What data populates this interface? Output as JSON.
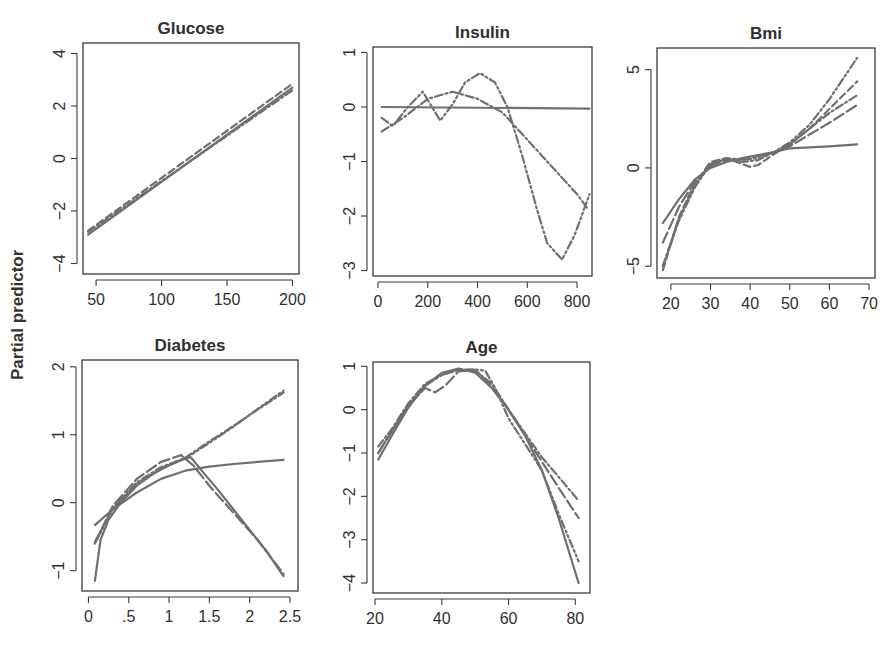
{
  "figure": {
    "shared_ylabel": "Partial predictor",
    "line_color": "#6f6f6f",
    "frame_color": "#3a3a3a",
    "text_color": "#2f2f2f"
  },
  "chart_data": [
    {
      "type": "line",
      "title": "Glucose",
      "xlabel": "",
      "ylabel": "Partial predictor",
      "xlim": [
        40,
        205
      ],
      "ylim": [
        -4.4,
        4.4
      ],
      "xticks": [
        50,
        100,
        150,
        200
      ],
      "xtick_labels": [
        "50",
        "100",
        "150",
        "200"
      ],
      "yticks": [
        4,
        2,
        0,
        -2,
        -4
      ],
      "ytick_labels": [
        "4",
        "2",
        "0",
        "−2",
        "−4"
      ],
      "frame": {
        "left": 83,
        "top": 43,
        "right": 299,
        "bottom": 274
      },
      "series": [
        {
          "name": "fit1",
          "style": "solid",
          "x": [
            44,
            200
          ],
          "y": [
            -2.9,
            2.7
          ]
        },
        {
          "name": "fit2",
          "style": "dashed",
          "x": [
            44,
            200
          ],
          "y": [
            -2.75,
            2.85
          ]
        },
        {
          "name": "fit3",
          "style": "dashdot",
          "x": [
            44,
            200
          ],
          "y": [
            -2.8,
            2.6
          ]
        }
      ]
    },
    {
      "type": "line",
      "title": "Insulin",
      "xlabel": "",
      "ylabel": "",
      "xlim": [
        -20,
        860
      ],
      "ylim": [
        -3.1,
        1.1
      ],
      "xticks": [
        0,
        200,
        400,
        600,
        800
      ],
      "xtick_labels": [
        "0",
        "200",
        "400",
        "600",
        "800"
      ],
      "yticks": [
        1,
        0,
        -1,
        -2,
        -3
      ],
      "ytick_labels": [
        "1",
        "0",
        "−1",
        "−2",
        "−3"
      ],
      "frame": {
        "left": 373,
        "top": 47,
        "right": 592,
        "bottom": 276
      },
      "series": [
        {
          "name": "fit1",
          "style": "solid",
          "x": [
            15,
            850
          ],
          "y": [
            0,
            -0.03
          ]
        },
        {
          "name": "fit2",
          "style": "dashdot",
          "x": [
            15,
            100,
            200,
            300,
            400,
            500,
            550,
            600,
            700,
            800,
            840
          ],
          "y": [
            -0.45,
            -0.2,
            0.15,
            0.28,
            0.15,
            -0.1,
            -0.35,
            -0.6,
            -1.1,
            -1.6,
            -1.85
          ]
        },
        {
          "name": "fit3",
          "style": "dashdotdot",
          "x": [
            15,
            60,
            120,
            180,
            250,
            300,
            350,
            410,
            470,
            520,
            580,
            640,
            680,
            740,
            790,
            850
          ],
          "y": [
            -0.2,
            -0.35,
            0.0,
            0.28,
            -0.25,
            0.05,
            0.45,
            0.62,
            0.45,
            0.0,
            -0.9,
            -1.9,
            -2.5,
            -2.8,
            -2.35,
            -1.6
          ]
        }
      ]
    },
    {
      "type": "line",
      "title": "Bmi",
      "xlabel": "",
      "ylabel": "",
      "xlim": [
        16.5,
        71.5
      ],
      "ylim": [
        -5.6,
        6.1
      ],
      "xticks": [
        20,
        30,
        40,
        50,
        60,
        70
      ],
      "xtick_labels": [
        "20",
        "30",
        "40",
        "50",
        "60",
        "70"
      ],
      "yticks": [
        5,
        0,
        -5
      ],
      "ytick_labels": [
        "5",
        "0",
        "−5"
      ],
      "frame": {
        "left": 657,
        "top": 48,
        "right": 875,
        "bottom": 278
      },
      "series": [
        {
          "name": "fit1",
          "style": "solid",
          "x": [
            18,
            22,
            26,
            30,
            34,
            38,
            42,
            46,
            50,
            55,
            60,
            67
          ],
          "y": [
            -2.8,
            -1.6,
            -0.6,
            0.0,
            0.3,
            0.5,
            0.65,
            0.8,
            1.0,
            1.05,
            1.1,
            1.2
          ]
        },
        {
          "name": "fit2",
          "style": "longdash",
          "x": [
            18,
            22,
            26,
            30,
            34,
            38,
            42,
            46,
            50,
            55,
            60,
            67
          ],
          "y": [
            -3.8,
            -2.0,
            -0.7,
            0.1,
            0.4,
            0.45,
            0.6,
            0.8,
            1.1,
            1.7,
            2.3,
            3.2
          ]
        },
        {
          "name": "fit3",
          "style": "dashdot",
          "x": [
            18,
            22,
            26,
            30,
            34,
            38,
            42,
            46,
            50,
            55,
            60,
            67
          ],
          "y": [
            -5.0,
            -2.6,
            -0.9,
            0.2,
            0.45,
            0.3,
            0.4,
            0.8,
            1.2,
            2.0,
            2.8,
            3.7
          ]
        },
        {
          "name": "fit4",
          "style": "dashed",
          "x": [
            18,
            22,
            26,
            30,
            34,
            38,
            40,
            42,
            46,
            50,
            55,
            60,
            67
          ],
          "y": [
            -5.2,
            -2.5,
            -0.8,
            0.3,
            0.5,
            0.2,
            0.05,
            0.15,
            0.7,
            1.2,
            2.0,
            3.0,
            4.4
          ]
        },
        {
          "name": "fit5",
          "style": "dashdotdot",
          "x": [
            18,
            22,
            26,
            30,
            34,
            38,
            42,
            46,
            50,
            55,
            60,
            67
          ],
          "y": [
            -5.0,
            -2.7,
            -1.0,
            0.2,
            0.5,
            0.4,
            0.5,
            0.8,
            1.3,
            2.2,
            3.5,
            5.6
          ]
        }
      ]
    },
    {
      "type": "line",
      "title": "Diabetes",
      "xlabel": "",
      "ylabel": "",
      "xlim": [
        -0.08,
        2.6
      ],
      "ylim": [
        -1.3,
        2.1
      ],
      "xticks": [
        0,
        0.5,
        1,
        1.5,
        2,
        2.5
      ],
      "xtick_labels": [
        "0",
        ".5",
        "1",
        "1.5",
        "2",
        "2.5"
      ],
      "yticks": [
        2,
        1,
        0,
        -1
      ],
      "ytick_labels": [
        "2",
        "1",
        "0",
        "−1"
      ],
      "frame": {
        "left": 82,
        "top": 360,
        "right": 298,
        "bottom": 591
      },
      "series": [
        {
          "name": "fit1",
          "style": "solid",
          "x": [
            0.08,
            0.3,
            0.6,
            0.9,
            1.2,
            1.5,
            1.8,
            2.1,
            2.42
          ],
          "y": [
            -0.33,
            -0.1,
            0.15,
            0.35,
            0.47,
            0.53,
            0.57,
            0.6,
            0.63
          ]
        },
        {
          "name": "fit2",
          "style": "solid",
          "x": [
            0.08,
            0.15,
            0.25,
            0.4,
            0.6,
            0.8,
            1.0,
            1.2,
            1.27,
            1.4,
            1.6,
            1.8,
            2.0,
            2.2,
            2.42
          ],
          "y": [
            -1.15,
            -0.55,
            -0.25,
            0.0,
            0.25,
            0.42,
            0.55,
            0.65,
            0.67,
            0.48,
            0.2,
            -0.1,
            -0.4,
            -0.7,
            -1.08
          ]
        },
        {
          "name": "fit3",
          "style": "longdash",
          "x": [
            0.08,
            0.3,
            0.6,
            0.9,
            1.15,
            1.3,
            1.5,
            1.8,
            2.1,
            2.42
          ],
          "y": [
            -0.6,
            -0.05,
            0.35,
            0.6,
            0.7,
            0.55,
            0.25,
            -0.15,
            -0.55,
            -1.05
          ]
        },
        {
          "name": "fit4",
          "style": "dashdotdot",
          "x": [
            0.08,
            0.3,
            0.6,
            0.9,
            1.2,
            1.5,
            1.8,
            2.1,
            2.42
          ],
          "y": [
            -0.6,
            -0.1,
            0.28,
            0.5,
            0.65,
            0.88,
            1.12,
            1.38,
            1.65
          ]
        },
        {
          "name": "fit5",
          "style": "dashdot",
          "x": [
            0.08,
            0.3,
            0.6,
            0.9,
            1.2,
            1.5,
            1.8,
            2.1,
            2.42
          ],
          "y": [
            -0.58,
            -0.08,
            0.3,
            0.52,
            0.66,
            0.9,
            1.13,
            1.37,
            1.62
          ]
        }
      ]
    },
    {
      "type": "line",
      "title": "Age",
      "xlabel": "",
      "ylabel": "",
      "xlim": [
        19.4,
        84.4
      ],
      "ylim": [
        -4.23,
        1.1
      ],
      "xticks": [
        20,
        40,
        60,
        80
      ],
      "xtick_labels": [
        "20",
        "40",
        "60",
        "80"
      ],
      "yticks": [
        1,
        0,
        -1,
        -2,
        -3,
        -4
      ],
      "ytick_labels": [
        "1",
        "0",
        "−1",
        "−2",
        "−3",
        "−4"
      ],
      "frame": {
        "left": 373,
        "top": 362,
        "right": 590,
        "bottom": 593
      },
      "series": [
        {
          "name": "fit1",
          "style": "solid",
          "x": [
            21,
            25,
            30,
            35,
            40,
            45,
            50,
            55,
            60,
            65,
            70,
            75,
            81
          ],
          "y": [
            -1.15,
            -0.6,
            0.05,
            0.55,
            0.85,
            0.95,
            0.85,
            0.5,
            0.0,
            -0.6,
            -1.4,
            -2.5,
            -4.0
          ]
        },
        {
          "name": "fit2",
          "style": "dashdot",
          "x": [
            21,
            25,
            30,
            35,
            40,
            45,
            50,
            55,
            60,
            65,
            70,
            75,
            81
          ],
          "y": [
            -0.85,
            -0.45,
            0.15,
            0.6,
            0.8,
            0.92,
            0.9,
            0.6,
            0.0,
            -0.55,
            -1.1,
            -1.55,
            -2.1
          ]
        },
        {
          "name": "fit3",
          "style": "longdash",
          "x": [
            21,
            25,
            30,
            35,
            38,
            41,
            45,
            50,
            55,
            60,
            65,
            70,
            75,
            81
          ],
          "y": [
            -1.0,
            -0.5,
            0.1,
            0.5,
            0.4,
            0.55,
            0.88,
            0.92,
            0.55,
            0.0,
            -0.6,
            -1.2,
            -1.8,
            -2.5
          ]
        },
        {
          "name": "fit4",
          "style": "dashdotdot",
          "x": [
            21,
            25,
            30,
            35,
            40,
            45,
            50,
            53,
            56,
            60,
            65,
            70,
            75,
            81
          ],
          "y": [
            -1.0,
            -0.5,
            0.1,
            0.55,
            0.8,
            0.92,
            0.93,
            0.9,
            0.5,
            -0.2,
            -0.8,
            -1.4,
            -2.4,
            -3.5
          ]
        }
      ]
    }
  ]
}
